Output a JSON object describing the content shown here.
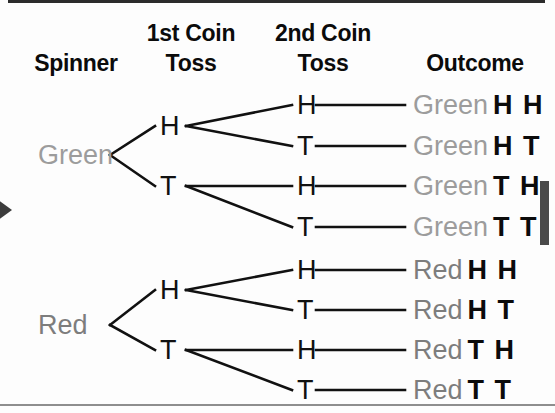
{
  "headers": {
    "spinner": "Spinner",
    "coin1_line1": "1st Coin",
    "coin1_line2": "Toss",
    "coin2_line1": "2nd Coin",
    "coin2_line2": "Toss",
    "outcome": "Outcome"
  },
  "colors": {
    "green_label": "#9c9c9c",
    "red_label": "#7d7d7d",
    "line": "#111111",
    "header_text": "#0b0b0b",
    "top_bar": "#2b2b2b",
    "bottom_rule": "#8e8e8e",
    "left_arrow": "#3c3c3c",
    "right_marker": "#4a4a4a"
  },
  "spinner_nodes": [
    {
      "label": "Green",
      "y": 155
    },
    {
      "label": "Red",
      "y": 325
    }
  ],
  "coin1_nodes": [
    {
      "label": "H",
      "y": 126
    },
    {
      "label": "T",
      "y": 186
    },
    {
      "label": "H",
      "y": 290
    },
    {
      "label": "T",
      "y": 350
    }
  ],
  "coin2_nodes": [
    {
      "label": "H",
      "y": 105
    },
    {
      "label": "T",
      "y": 146
    },
    {
      "label": "H",
      "y": 186
    },
    {
      "label": "T",
      "y": 227
    },
    {
      "label": "H",
      "y": 270
    },
    {
      "label": "T",
      "y": 310
    },
    {
      "label": "H",
      "y": 350
    },
    {
      "label": "T",
      "y": 390
    }
  ],
  "outcomes": [
    {
      "color_label": "Green",
      "tone": "green",
      "toss": "H H",
      "y": 105
    },
    {
      "color_label": "Green",
      "tone": "green",
      "toss": "H T",
      "y": 146
    },
    {
      "color_label": "Green",
      "tone": "green",
      "toss": "T H",
      "y": 186
    },
    {
      "color_label": "Green",
      "tone": "green",
      "toss": "T T",
      "y": 227
    },
    {
      "color_label": "Red",
      "tone": "red",
      "toss": "H H",
      "y": 270
    },
    {
      "color_label": "Red",
      "tone": "red",
      "toss": "H T",
      "y": 310
    },
    {
      "color_label": "Red",
      "tone": "red",
      "toss": "T H",
      "y": 350
    },
    {
      "color_label": "Red",
      "tone": "red",
      "toss": "T T",
      "y": 390
    }
  ],
  "chart_data": {
    "type": "diagram",
    "stages": [
      "Spinner",
      "1st Coin Toss",
      "2nd Coin Toss",
      "Outcome"
    ],
    "branches": {
      "Spinner": [
        "Green",
        "Red"
      ],
      "1st Coin Toss": [
        "H",
        "T"
      ],
      "2nd Coin Toss": [
        "H",
        "T"
      ]
    },
    "leaf_count": 8,
    "outcomes": [
      "Green H H",
      "Green H T",
      "Green T H",
      "Green T T",
      "Red H H",
      "Red H T",
      "Red T H",
      "Red T T"
    ]
  }
}
